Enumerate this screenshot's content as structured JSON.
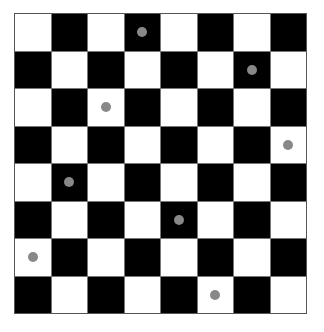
{
  "board": {
    "rows": 8,
    "cols": 8,
    "light_color": "#ffffff",
    "dark_color": "#000000",
    "top_left": "light",
    "dot_color": "#888888",
    "dots": [
      {
        "row": 0,
        "col": 3
      },
      {
        "row": 1,
        "col": 6
      },
      {
        "row": 2,
        "col": 2
      },
      {
        "row": 3,
        "col": 7
      },
      {
        "row": 4,
        "col": 1
      },
      {
        "row": 5,
        "col": 4
      },
      {
        "row": 6,
        "col": 0
      },
      {
        "row": 7,
        "col": 5
      }
    ]
  }
}
